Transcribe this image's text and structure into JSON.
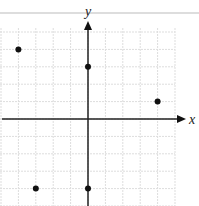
{
  "chart_data": {
    "type": "scatter",
    "title": "",
    "xlabel": "x",
    "ylabel": "y",
    "grid": true,
    "xlim": [
      -5,
      5
    ],
    "ylim": [
      -5,
      4
    ],
    "points": [
      {
        "x": -4,
        "y": 4
      },
      {
        "x": 0,
        "y": 3
      },
      {
        "x": 4,
        "y": 1
      },
      {
        "x": -3,
        "y": -4
      },
      {
        "x": 0,
        "y": -4
      }
    ]
  },
  "labels": {
    "x_axis": "x",
    "y_axis": "y"
  }
}
